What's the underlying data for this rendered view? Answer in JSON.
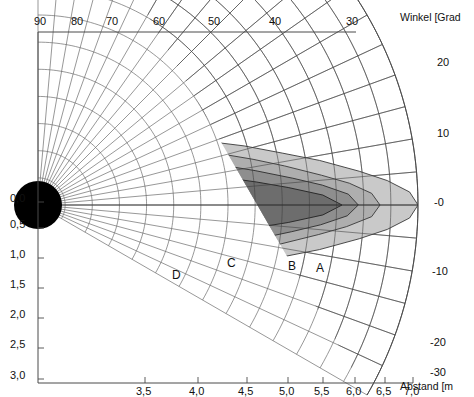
{
  "figure": {
    "type": "polar-coverage-diagram",
    "background": "#ffffff",
    "frame_color": "#555555"
  },
  "axes": {
    "top": {
      "title": "",
      "unit": "Grad",
      "ticks": [
        {
          "label": "90",
          "x": 42
        },
        {
          "label": "80",
          "x": 79
        },
        {
          "label": "70",
          "x": 114
        },
        {
          "label": "60",
          "x": 161
        },
        {
          "label": "50",
          "x": 216
        },
        {
          "label": "40",
          "x": 277
        },
        {
          "label": "30",
          "x": 354
        }
      ]
    },
    "right": {
      "title": "Winkel [Grad",
      "title_x": 400,
      "title_y": 12,
      "ticks": [
        {
          "label": "20",
          "x": 437,
          "y": 63
        },
        {
          "label": "10",
          "x": 437,
          "y": 134
        },
        {
          "label": "-0",
          "x": 434,
          "y": 203
        },
        {
          "label": "-10",
          "x": 432,
          "y": 272
        },
        {
          "label": "-20",
          "x": 430,
          "y": 343
        },
        {
          "label": "-30",
          "x": 430,
          "y": 373
        }
      ]
    },
    "left": {
      "title": "",
      "unit": "m",
      "ticks": [
        {
          "label": "0,0",
          "y": 198
        },
        {
          "label": "0,5",
          "y": 224
        },
        {
          "label": "1,0",
          "y": 254
        },
        {
          "label": "1,5",
          "y": 284
        },
        {
          "label": "2,0",
          "y": 314
        },
        {
          "label": "2,5",
          "y": 344
        },
        {
          "label": "3,0",
          "y": 375
        }
      ]
    },
    "bottom": {
      "title": "Abstand [m",
      "title_x": 400,
      "title_y": 381,
      "ticks": [
        {
          "label": "3,5",
          "x": 145
        },
        {
          "label": "4,0",
          "x": 198
        },
        {
          "label": "4,5",
          "x": 247
        },
        {
          "label": "5,0",
          "x": 288
        },
        {
          "label": "5,5",
          "x": 323
        },
        {
          "label": "6,0",
          "x": 355
        },
        {
          "label": "6,5",
          "x": 385
        },
        {
          "label": "7,0",
          "x": 413
        }
      ]
    }
  },
  "zone_labels": [
    {
      "id": "A",
      "x": 316,
      "y": 262
    },
    {
      "id": "B",
      "x": 288,
      "y": 260
    },
    {
      "id": "C",
      "x": 227,
      "y": 257
    },
    {
      "id": "D",
      "x": 172,
      "y": 269
    }
  ],
  "chart_data": {
    "type": "contour-polar",
    "title": "",
    "xlabel": "Abstand [m",
    "ylabel": "Winkel [Grad",
    "origin": {
      "x": 38,
      "y": 205
    },
    "radial_unit": "m",
    "radial_range": [
      0,
      7.0
    ],
    "radial_ticks": [
      0.0,
      0.5,
      1.0,
      1.5,
      2.0,
      2.5,
      3.0,
      3.5,
      4.0,
      4.5,
      5.0,
      5.5,
      6.0,
      6.5,
      7.0
    ],
    "angle_unit": "Grad",
    "angle_range": [
      -30,
      90
    ],
    "angle_ticks": [
      90,
      80,
      70,
      60,
      50,
      40,
      30,
      20,
      10,
      0,
      -10,
      -20,
      -30
    ],
    "grid": true,
    "legend": "none",
    "series": [
      {
        "name": "A",
        "fill": "#c9c9c9",
        "stroke": "#3a3a3a",
        "description": "outermost coverage lobe, reaches about 7,0 m on axis",
        "max_range_m": 7.0
      },
      {
        "name": "B",
        "fill": "#aeaeae",
        "stroke": "#3a3a3a",
        "description": "second coverage lobe, reaches about 6,3 m on axis",
        "max_range_m": 6.3
      },
      {
        "name": "C",
        "fill": "#8f8f8f",
        "stroke": "#2e2e2e",
        "description": "third coverage lobe, reaches about 5,9 m on axis",
        "max_range_m": 5.9
      },
      {
        "name": "D",
        "fill": "#6e6e6e",
        "stroke": "#222222",
        "description": "innermost dark lobe, reaches about 5,6 m on axis",
        "max_range_m": 5.6
      }
    ],
    "emitter": {
      "shape": "half-disc",
      "fill": "#000000",
      "radius_px": 24
    }
  },
  "colors": {
    "zone_a": "#c9c9c9",
    "zone_b": "#aeaeae",
    "zone_c": "#8f8f8f",
    "zone_d": "#6e6e6e",
    "emitter": "#000000",
    "grid": "#6b6b6b",
    "frame": "#4a4a4a",
    "text": "#111111"
  }
}
